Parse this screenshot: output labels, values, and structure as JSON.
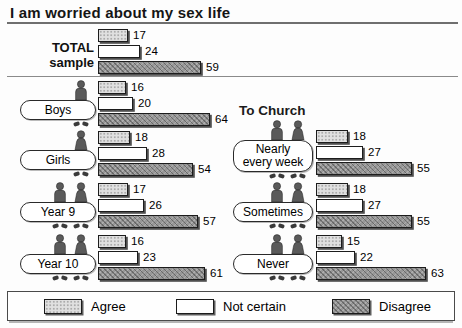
{
  "title": "I am worried about my sex life",
  "right_heading": "To Church",
  "legend": {
    "items": [
      {
        "key": "agree",
        "label": "Agree"
      },
      {
        "key": "not_certain",
        "label": "Not certain"
      },
      {
        "key": "disagree",
        "label": "Disagree"
      }
    ]
  },
  "colors": {
    "agree": "#e0e0e0",
    "not_certain": "#ffffff",
    "disagree": "#979797",
    "bar_border": "#1c1c1c",
    "figure": "#5a5a5a",
    "feet": "#3a3a3a"
  },
  "chart_data": {
    "type": "bar",
    "orientation": "horizontal",
    "unit": "percent",
    "title": "I am worried about my sex life",
    "series": [
      "Agree",
      "Not certain",
      "Disagree"
    ],
    "xlim": [
      0,
      70
    ],
    "grid": false,
    "legend_position": "bottom",
    "columns": [
      {
        "id": "left",
        "heading": null,
        "groups": [
          {
            "label": "TOTAL sample",
            "display": "TOTAL\nsample",
            "pill": false,
            "figures": [],
            "values": [
              17,
              24,
              59
            ]
          },
          {
            "label": "Boys",
            "pill": true,
            "figures": [
              "male"
            ],
            "values": [
              16,
              20,
              64
            ]
          },
          {
            "label": "Girls",
            "pill": true,
            "figures": [
              "female"
            ],
            "values": [
              18,
              28,
              54
            ]
          },
          {
            "label": "Year 9",
            "pill": true,
            "figures": [
              "male",
              "female"
            ],
            "values": [
              17,
              26,
              57
            ]
          },
          {
            "label": "Year 10",
            "pill": true,
            "figures": [
              "male",
              "female"
            ],
            "values": [
              16,
              23,
              61
            ]
          }
        ]
      },
      {
        "id": "right",
        "heading": "To Church",
        "groups": [
          {
            "label": "Nearly every week",
            "display": "Nearly\nevery week",
            "pill": true,
            "two_line": true,
            "figures": [
              "male",
              "female"
            ],
            "values": [
              18,
              27,
              55
            ]
          },
          {
            "label": "Sometimes",
            "pill": true,
            "figures": [
              "male",
              "female"
            ],
            "values": [
              18,
              27,
              55
            ]
          },
          {
            "label": "Never",
            "pill": true,
            "figures": [
              "male",
              "female"
            ],
            "values": [
              15,
              22,
              63
            ]
          }
        ]
      }
    ]
  }
}
